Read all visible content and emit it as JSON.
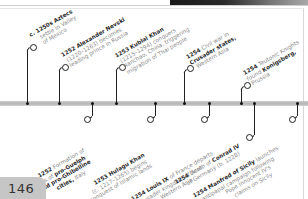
{
  "page": {
    "number": "146",
    "colors": {
      "axis": "#bdbdbd",
      "bold_text": "#2a2a2a",
      "body_text": "#8a8a8a",
      "page_tab": "#c6c6c6"
    }
  },
  "events_above": [
    {
      "year": "c. 1250s",
      "bold": "Aztecs",
      "lines": [
        "settle in Valley",
        "of Mexico"
      ]
    },
    {
      "year": "1252",
      "bold": "Alexander Nevski",
      "lines": [
        "(1220–1263) becomes",
        "leading prince in Russia"
      ]
    },
    {
      "year": "1253",
      "bold": "Kublai Khan",
      "lines": [
        "(1215–1294) conquers",
        "Nanchao, China, triggering",
        "migration of Thai people"
      ]
    },
    {
      "year": "1254",
      "text": "Civil war in",
      "bold2": "Crusader states,",
      "lines": [
        "Western Asia"
      ]
    },
    {
      "year": "1254",
      "text": "Teutonic Knights",
      "pre": "found",
      "bold2": "Konigsberg,",
      "lines": [
        "Prussia"
      ]
    }
  ],
  "events_below": [
    {
      "year": "1252",
      "text": "Formation of",
      "lines": [
        "leagues of",
        "and pro-Ghibelline",
        "cities, Italy"
      ],
      "bold_parts": [
        "pro-Guelph",
        "and pro-Ghibelline",
        "cities"
      ]
    },
    {
      "year": "1253",
      "bold": "Hulagu Khan",
      "lines": [
        "(c. 1217–1265) begins",
        "conquest of Islamic lands"
      ]
    },
    {
      "year": "1254",
      "bold": "Louis IX",
      "text": "of France departs",
      "lines": [
        "Crusader kingdom of Acre,",
        "Western Asia"
      ]
    },
    {
      "year": "1254",
      "text": "Death of",
      "bold2": "Conrad IV",
      "lines": [
        "of Germany (b. 1228)"
      ]
    },
    {
      "year": "1254",
      "bold": "Manfred of Sicily",
      "text": "launches",
      "lines": [
        "antipapal campaign following",
        "Pope Innocent IV's",
        "claims on Sicily"
      ]
    }
  ],
  "labels": {
    "a1_l1_year": "c. 1250s",
    "a1_l1_bold": "Aztecs",
    "a1_l2": "settle in Valley",
    "a1_l3": "of Mexico",
    "a2_l1_year": "1252",
    "a2_l1_bold": "Alexander Nevski",
    "a2_l2": "(1220–1263) becomes",
    "a2_l3": "leading prince in Russia",
    "a3_l1_year": "1253",
    "a3_l1_bold": "Kublai Khan",
    "a3_l2": "(1215–1294) conquers",
    "a3_l3": "Nanchao, China, triggering",
    "a3_l4": "migration of Thai people",
    "a4_l1_year": "1254",
    "a4_l1_text": "Civil war in",
    "a4_l2_bold": "Crusader states,",
    "a4_l3": "Western Asia",
    "a5_l1_year": "1254",
    "a5_l1_text": "Teutonic Knights",
    "a5_l2_pre": "found",
    "a5_l2_bold": "Konigsberg,",
    "a5_l3": "Prussia",
    "b1_l1_year": "1252",
    "b1_l1_text": "Formation of",
    "b1_l2_pre": "leagues of",
    "b1_l2_bold": "pro-Guelph",
    "b1_l3_bold": "and pro-Ghibelline",
    "b1_l4_bold": "cities,",
    "b1_l4_text": "Italy",
    "b2_l1_year": "1253",
    "b2_l1_bold": "Hulagu Khan",
    "b2_l2": "(c. 1217–1265) begins",
    "b2_l3": "conquest of Islamic lands",
    "b3_l1_year": "1254",
    "b3_l1_bold": "Louis IX",
    "b3_l1_text": "of France departs",
    "b3_l2": "Crusader kingdom of Acre,",
    "b3_l3": "Western Asia",
    "b4_l1_year": "1254",
    "b4_l1_text": "Death of",
    "b4_l1_bold": "Conrad IV",
    "b4_l2": "of Germany (b. 1228)",
    "b5_l1_year": "1254",
    "b5_l1_bold": "Manfred of Sicily",
    "b5_l1_text": "launches",
    "b5_l2": "antipapal campaign following",
    "b5_l3": "Pope Innocent IV's",
    "b5_l4": "claims on Sicily"
  }
}
